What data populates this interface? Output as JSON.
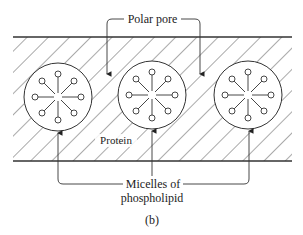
{
  "diagram": {
    "labels": {
      "polar_pore": "Polar pore",
      "protein": "Protein",
      "micelles_line1": "Micelles of",
      "micelles_line2": "phospholipid",
      "caption": "(b)"
    },
    "colors": {
      "line": "#333333",
      "background": "#ffffff"
    },
    "micelles": [
      {
        "cx": 58,
        "cy": 97,
        "r": 34
      },
      {
        "cx": 152,
        "cy": 95,
        "r": 34
      },
      {
        "cx": 248,
        "cy": 95,
        "r": 34
      }
    ]
  }
}
